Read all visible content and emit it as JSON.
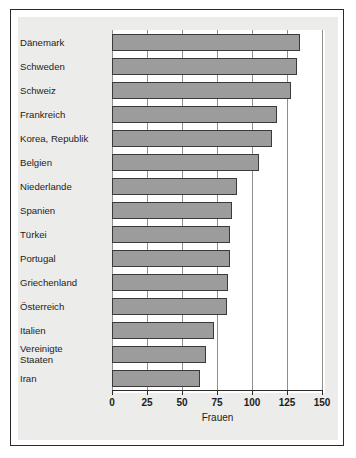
{
  "chart_data": {
    "type": "bar",
    "orientation": "horizontal",
    "title": "",
    "xlabel": "Frauen",
    "ylabel": "",
    "xlim": [
      0,
      150
    ],
    "xticks": [
      0,
      25,
      50,
      75,
      100,
      125,
      150
    ],
    "xtick_labels": [
      "0",
      "25",
      "50",
      "75",
      "100",
      "125",
      "150"
    ],
    "grid": true,
    "grid_axis": "x",
    "legend": false,
    "categories": [
      "Dänemark",
      "Schweden",
      "Schweiz",
      "Frankreich",
      "Korea, Republik",
      "Belgien",
      "Niederlande",
      "Spanien",
      "Türkei",
      "Portugal",
      "Griechenland",
      "Österreich",
      "Italien",
      "Vereinigte\nStaaten",
      "Iran"
    ],
    "values": [
      134,
      132,
      128,
      118,
      114,
      105,
      89,
      86,
      84,
      84,
      83,
      82,
      73,
      67,
      63
    ],
    "bar_color": "#9c9c9c",
    "bar_edge_color": "#3a3a3a",
    "plot_background": "#ffffff",
    "panel_background": "#ececeb",
    "frame_color": "#2b2b2b"
  },
  "axis": {
    "x_title": "Frauen"
  }
}
